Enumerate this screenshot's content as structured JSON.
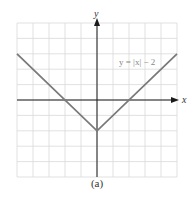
{
  "chart_data": {
    "type": "line",
    "title": "",
    "caption": "(a)",
    "xlabel": "x",
    "ylabel": "y",
    "xlim": [
      -5,
      5
    ],
    "ylim": [
      -5,
      5
    ],
    "grid": true,
    "series": [
      {
        "name": "y = |x| − 2",
        "x": [
          -5,
          0,
          5
        ],
        "y": [
          3,
          -2,
          3
        ]
      }
    ],
    "annotations": [
      {
        "text": "y = |x| − 2",
        "x": 2.5,
        "y": 2.5
      }
    ]
  },
  "labels": {
    "x_axis": "x",
    "y_axis": "y",
    "equation": "y = |x| − 2",
    "caption": "(a)"
  },
  "colors": {
    "grid": "#d9d9d9",
    "axis": "#1a1a1a",
    "curve": "#7a7a7a",
    "label": "#888888"
  }
}
